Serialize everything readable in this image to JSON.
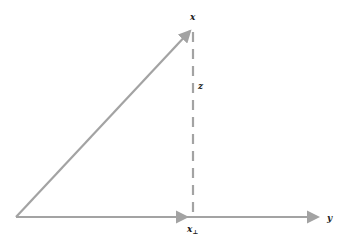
{
  "diagram": {
    "type": "vector-decomposition",
    "colors": {
      "arrow": "#a3a3a3",
      "label": "#222222",
      "background": "#ffffff"
    },
    "labels": {
      "x": "x",
      "y": "y",
      "z": "z",
      "x_perp_base": "x",
      "x_perp_sub": "⊥"
    },
    "elements": [
      {
        "id": "vector-x",
        "from": [
          16,
          217
        ],
        "to": [
          193,
          28
        ],
        "style": "solid-arrow"
      },
      {
        "id": "axis-y",
        "from": [
          16,
          217
        ],
        "to": [
          322,
          217
        ],
        "style": "solid-arrow"
      },
      {
        "id": "projection-x-perp",
        "from": [
          16,
          217
        ],
        "to": [
          190,
          217
        ],
        "style": "solid-arrow"
      },
      {
        "id": "component-z",
        "from": [
          193,
          30
        ],
        "to": [
          193,
          217
        ],
        "style": "dashed-line"
      }
    ]
  }
}
